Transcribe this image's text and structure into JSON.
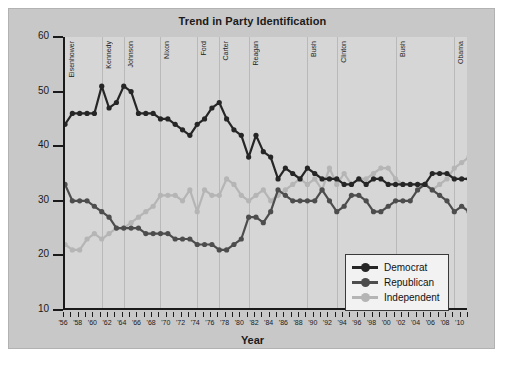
{
  "chart_data": {
    "type": "line",
    "title": "Trend in Party Identification",
    "xlabel": "Year",
    "ylabel": "",
    "xlim": [
      1956,
      2011
    ],
    "ylim": [
      10,
      60
    ],
    "yticks": [
      10,
      20,
      30,
      40,
      50,
      60
    ],
    "grid": false,
    "legend_position": "bottom-right",
    "x": [
      1956,
      1957,
      1958,
      1959,
      1960,
      1961,
      1962,
      1963,
      1964,
      1965,
      1966,
      1967,
      1968,
      1969,
      1970,
      1971,
      1972,
      1973,
      1974,
      1975,
      1976,
      1977,
      1978,
      1979,
      1980,
      1981,
      1982,
      1983,
      1984,
      1985,
      1986,
      1987,
      1988,
      1989,
      1990,
      1991,
      1992,
      1993,
      1994,
      1995,
      1996,
      1997,
      1998,
      1999,
      2000,
      2001,
      2002,
      2003,
      2004,
      2005,
      2006,
      2007,
      2008,
      2009,
      2010,
      2011
    ],
    "xticklabels": [
      "'56",
      "'58",
      "'60",
      "'62",
      "'64",
      "'66",
      "'68",
      "'70",
      "'72",
      "'74",
      "'76",
      "'78",
      "'80",
      "'82",
      "'84",
      "'86",
      "'88",
      "'90",
      "'92",
      "'94",
      "'96",
      "'98",
      "'00",
      "'02",
      "'04",
      "'06",
      "'08",
      "'10"
    ],
    "series": [
      {
        "name": "Democrat",
        "color": "#262626",
        "values": [
          44,
          46,
          46,
          46,
          46,
          51,
          47,
          48,
          51,
          50,
          46,
          46,
          46,
          45,
          45,
          44,
          43,
          42,
          44,
          45,
          47,
          48,
          45,
          43,
          42,
          38,
          42,
          39,
          38,
          34,
          36,
          35,
          34,
          36,
          35,
          34,
          34,
          34,
          33,
          33,
          34,
          33,
          34,
          34,
          33,
          33,
          33,
          33,
          33,
          33,
          35,
          35,
          35,
          34,
          34,
          34
        ]
      },
      {
        "name": "Republican",
        "color": "#4d4d4d",
        "values": [
          33,
          30,
          30,
          30,
          29,
          28,
          27,
          25,
          25,
          25,
          25,
          24,
          24,
          24,
          24,
          23,
          23,
          23,
          22,
          22,
          22,
          21,
          21,
          22,
          23,
          27,
          27,
          26,
          28,
          32,
          31,
          30,
          30,
          30,
          30,
          32,
          30,
          28,
          29,
          31,
          31,
          30,
          28,
          28,
          29,
          30,
          30,
          30,
          32,
          33,
          32,
          31,
          30,
          28,
          29,
          28
        ]
      },
      {
        "name": "Independent",
        "color": "#b5b5b5",
        "values": [
          22,
          21,
          21,
          23,
          24,
          23,
          24,
          25,
          25,
          26,
          27,
          28,
          29,
          31,
          31,
          31,
          30,
          32,
          28,
          32,
          31,
          31,
          34,
          33,
          31,
          30,
          31,
          32,
          30,
          31,
          32,
          33,
          34,
          33,
          34,
          32,
          36,
          33,
          35,
          33,
          34,
          34,
          35,
          36,
          36,
          34,
          33,
          33,
          33,
          33,
          32,
          33,
          34,
          36,
          37,
          38
        ]
      }
    ],
    "presidents": [
      {
        "name": "Eisenhower",
        "start": 1956,
        "end": 1961
      },
      {
        "name": "Kennedy",
        "start": 1961,
        "end": 1964
      },
      {
        "name": "Johnson",
        "start": 1964,
        "end": 1969
      },
      {
        "name": "Nixon",
        "start": 1969,
        "end": 1974
      },
      {
        "name": "Ford",
        "start": 1974,
        "end": 1977
      },
      {
        "name": "Carter",
        "start": 1977,
        "end": 1981
      },
      {
        "name": "Reagan",
        "start": 1981,
        "end": 1989
      },
      {
        "name": "Bush",
        "start": 1989,
        "end": 1993
      },
      {
        "name": "Clinton",
        "start": 1993,
        "end": 2001
      },
      {
        "name": "Bush",
        "start": 2001,
        "end": 2009
      },
      {
        "name": "Obama",
        "start": 2009,
        "end": 2011
      }
    ]
  },
  "legend": {
    "items": [
      {
        "label": "Democrat",
        "color": "#262626"
      },
      {
        "label": "Republican",
        "color": "#4d4d4d"
      },
      {
        "label": "Independent",
        "color": "#b5b5b5"
      }
    ]
  }
}
